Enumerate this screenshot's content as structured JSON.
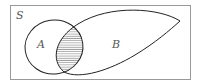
{
  "diagram": {
    "type": "venn",
    "universe": {
      "label": "S"
    },
    "sets": [
      {
        "id": "A",
        "label": "A"
      },
      {
        "id": "B",
        "label": "B"
      }
    ],
    "shaded_region": "A ∩ B",
    "colors": {
      "stroke": "#222222",
      "frame": "#999999",
      "hatch": "#777777",
      "label": "#555555"
    }
  }
}
